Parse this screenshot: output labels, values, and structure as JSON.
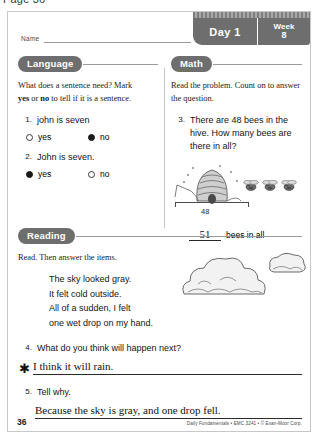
{
  "page_caption": "Page 36",
  "header": {
    "name_label": "Name",
    "day_label": "Day 1",
    "week_word": "Week",
    "week_number": "8"
  },
  "language": {
    "title": "Language",
    "instructions_line1": "What does a sentence need? Mark",
    "instructions_yes": "yes",
    "instructions_mid": " or ",
    "instructions_no": "no",
    "instructions_line2_tail": " to tell if it is a sentence.",
    "items": [
      {
        "number": "1.",
        "text": "john is seven",
        "choices": [
          {
            "label": "yes",
            "selected": false
          },
          {
            "label": "no",
            "selected": true
          }
        ]
      },
      {
        "number": "2.",
        "text": "John is seven.",
        "choices": [
          {
            "label": "yes",
            "selected": true
          },
          {
            "label": "no",
            "selected": false
          }
        ]
      }
    ]
  },
  "math": {
    "title": "Math",
    "instructions": "Read the problem. Count on to answer the question.",
    "item": {
      "number": "3.",
      "text": "There are 48 bees in the hive. How many bees are there in all?"
    },
    "illustration": {
      "name": "beehive-with-bees",
      "bracket_label": "48",
      "bee_count": 3
    },
    "answer": "51",
    "answer_unit": "bees in all"
  },
  "reading": {
    "title": "Reading",
    "instructions": "Read. Then answer the items.",
    "passage": [
      "The sky looked gray.",
      "It felt cold outside.",
      "All of a sudden, I felt",
      "one wet drop on my hand."
    ],
    "illustration": {
      "name": "clouds"
    },
    "items": [
      {
        "number": "4.",
        "question": "What do you think will happen next?",
        "marker": "✱",
        "answer": "I think it will rain."
      },
      {
        "number": "5.",
        "question": "Tell why.",
        "marker": "",
        "answer": "Because the sky is gray, and one drop fell."
      }
    ]
  },
  "footer": {
    "page_number": "36",
    "credit": "Daily Fundamentals • EMC 3241 • © Evan-Moor Corp."
  },
  "colors": {
    "pill": "#6e6e6e",
    "rule": "#9b9b9b",
    "ink": "#141414",
    "sheet_border": "#c8c8c8"
  }
}
